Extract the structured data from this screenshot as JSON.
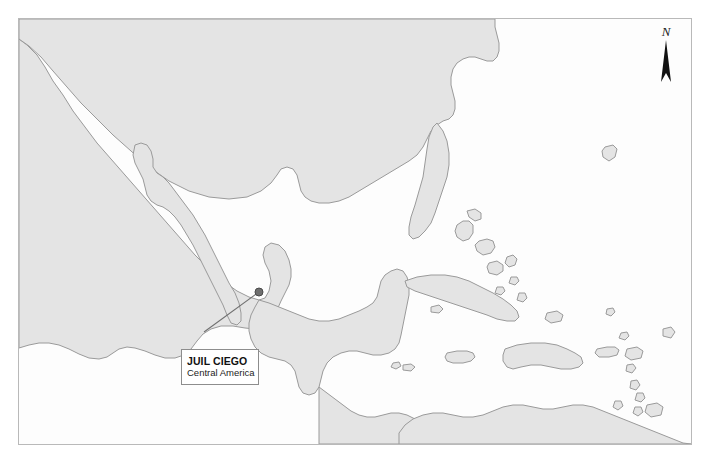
{
  "map": {
    "region_name": "Central America and Caribbean",
    "background_color": "#fdfdfd",
    "land_fill": "#e4e4e4",
    "coastline_color": "#9a9a9a",
    "frame_color": "#b9b9b9",
    "north_arrow": {
      "label": "N",
      "icon": "north-arrow-icon"
    },
    "marker": {
      "icon": "map-pin-dot-icon",
      "color": "#6a6a6a",
      "x": 258,
      "y": 291
    },
    "leader_line": {
      "color": "#6f6f6f",
      "from_x": 258,
      "from_y": 291,
      "to_x": 203,
      "to_y": 331
    },
    "callout": {
      "title": "JUIL CIEGO",
      "subtitle": "Central America",
      "border_color": "#8d8d8d",
      "background_color": "#ffffff"
    }
  }
}
